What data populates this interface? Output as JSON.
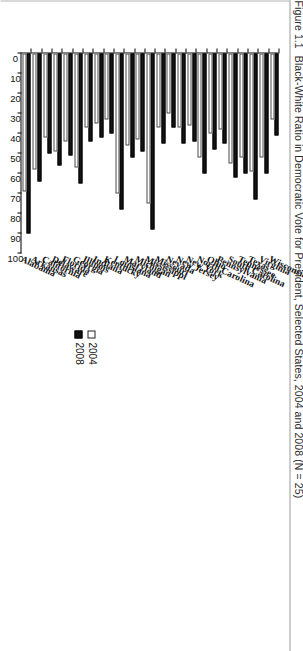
{
  "figure": {
    "number": "Figure 1.1",
    "caption": "Black-White Ratio in Democratic Vote for President, Selected States, 2004 and 2008 (N = 25)"
  },
  "legend": {
    "position": "upper-left",
    "entries": [
      {
        "label": "2004",
        "swatch": "hollow-square",
        "color": "#ffffff"
      },
      {
        "label": "2008",
        "swatch": "filled-square",
        "color": "#111111"
      }
    ]
  },
  "chart_data": {
    "type": "bar",
    "orientation": "horizontal",
    "title": "Black-White Ratio in Democratic Vote for President, Selected States, 2004 and 2008 (N = 25)",
    "xlabel": "",
    "ylabel": "",
    "ylim": [
      0,
      100
    ],
    "grid": false,
    "ticks": [
      0,
      10,
      20,
      30,
      40,
      50,
      60,
      70,
      80,
      90,
      100
    ],
    "tick_labels": [
      "0",
      "10",
      "20",
      "30",
      "40",
      "50",
      "60",
      "70",
      "80",
      "90",
      "100"
    ],
    "categories": [
      "Alabama",
      "Arkansas",
      "California",
      "Delaware",
      "Florida",
      "Georgia",
      "Illinois",
      "Indiana",
      "Kentucky",
      "Louisiana",
      "Maryland",
      "Michigan",
      "Mississippi",
      "Missouri",
      "Nevada",
      "New Jersey",
      "New York",
      "North Carolina",
      "Ohio",
      "Pennsylvania",
      "South Carolina",
      "Tennessee",
      "Texas",
      "Virginia",
      "Wisconsin"
    ],
    "series": [
      {
        "name": "2004",
        "color": "#ffffff",
        "values": [
          69,
          58,
          42,
          49,
          44,
          57,
          37,
          35,
          33,
          70,
          46,
          43,
          75,
          37,
          30,
          37,
          36,
          52,
          40,
          38,
          55,
          52,
          59,
          52,
          33
        ]
      },
      {
        "name": "2008",
        "color": "#111111",
        "values": [
          90,
          64,
          50,
          56,
          51,
          65,
          44,
          42,
          40,
          78,
          52,
          49,
          88,
          45,
          37,
          45,
          44,
          60,
          48,
          45,
          62,
          60,
          73,
          60,
          41
        ]
      }
    ]
  }
}
